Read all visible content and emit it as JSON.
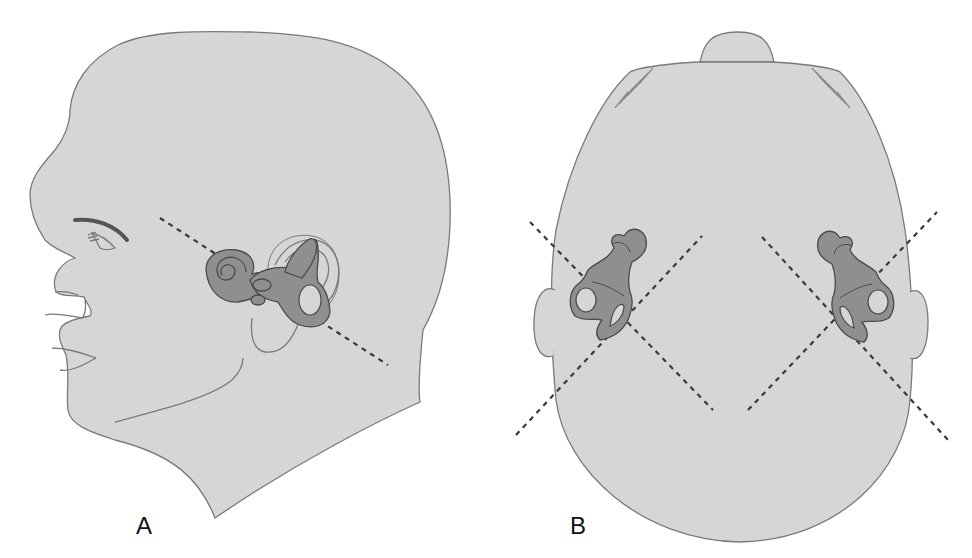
{
  "figure": {
    "panels": [
      {
        "id": "A",
        "label": "A",
        "view": "lateral head profile with inner ear (labyrinth) and dashed plane line"
      },
      {
        "id": "B",
        "label": "B",
        "view": "superior (top-down) head view with bilateral inner ears and crossing dashed plane lines"
      }
    ],
    "colors": {
      "skin": "#d6d6d6",
      "outline": "#7a7a7a",
      "labyrinth": "#8f8f8f",
      "labyrinth_outline": "#4a4a4a",
      "dash": "#3a3a3a",
      "background": "#ffffff"
    }
  }
}
